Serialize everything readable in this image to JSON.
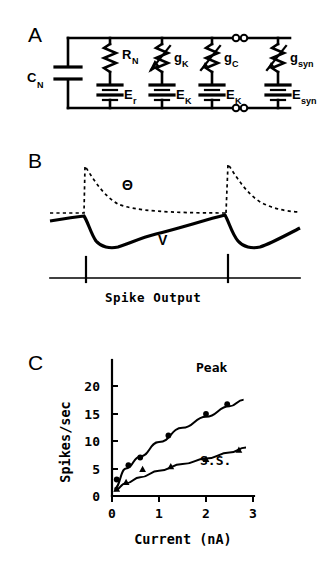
{
  "figure": {
    "panels": [
      {
        "id": "A",
        "letter": "A",
        "name": "equivalent-circuit"
      },
      {
        "id": "B",
        "letter": "B",
        "name": "voltage-threshold-traces"
      },
      {
        "id": "C",
        "letter": "C",
        "name": "fi-curve"
      }
    ]
  },
  "panel_a": {
    "letter": "A",
    "capacitor": {
      "label": "C",
      "sub": "N",
      "name": "membrane-capacitance"
    },
    "branches": [
      {
        "element_label": "R",
        "element_sub": "N",
        "element_type": "resistor",
        "battery_label": "E",
        "battery_sub": "r",
        "name": "leak-branch"
      },
      {
        "element_label": "g",
        "element_sub": "K",
        "element_type": "variable-resistor",
        "battery_label": "E",
        "battery_sub": "K",
        "name": "potassium-branch"
      },
      {
        "element_label": "g",
        "element_sub": "C",
        "element_type": "variable-resistor",
        "battery_label": "E",
        "battery_sub": "K",
        "name": "calcium-activated-branch"
      },
      {
        "element_label": "g",
        "element_sub": "syn",
        "element_type": "variable-resistor",
        "battery_label": "E",
        "battery_sub": "syn",
        "name": "synaptic-branch"
      }
    ]
  },
  "panel_b": {
    "letter": "B",
    "theta_label": "Θ",
    "voltage_label": "V",
    "caption": "Spike Output",
    "spike_times": [
      2,
      2
    ]
  },
  "panel_c": {
    "letter": "C",
    "peak_label": "Peak",
    "ss_label": "S.S."
  },
  "chart_data": {
    "type": "scatter",
    "title": "",
    "xlabel": "Current  (nA)",
    "ylabel": "Spikes/sec",
    "xlim": [
      0,
      3
    ],
    "ylim": [
      0,
      22
    ],
    "xticks": [
      0,
      1,
      2,
      3
    ],
    "xticklabels": [
      "0",
      "1",
      "2",
      "3"
    ],
    "yticks": [
      0,
      5,
      10,
      15,
      20
    ],
    "yticklabels": [
      "0",
      "5",
      "10",
      "15",
      "20"
    ],
    "grid": false,
    "legend_position": "inline-annotation",
    "series": [
      {
        "name": "Peak",
        "marker": "circle",
        "x": [
          0.1,
          0.35,
          0.6,
          1.2,
          2.0,
          2.45
        ],
        "y": [
          3.0,
          5.6,
          7.0,
          11.0,
          14.9,
          16.7
        ],
        "fit_x": [
          0.05,
          0.3,
          0.6,
          1.0,
          1.5,
          2.0,
          2.5,
          2.8
        ],
        "fit_y": [
          1.3,
          5.0,
          7.2,
          9.8,
          12.4,
          14.4,
          16.3,
          17.5
        ]
      },
      {
        "name": "S.S.",
        "marker": "triangle",
        "x": [
          0.1,
          0.3,
          0.65,
          1.25,
          2.0,
          2.7
        ],
        "y": [
          1.3,
          2.5,
          4.9,
          5.4,
          6.7,
          8.4
        ],
        "fit_x": [
          0.05,
          0.3,
          0.6,
          1.0,
          1.5,
          2.0,
          2.5,
          2.85
        ],
        "fit_y": [
          1.0,
          2.3,
          3.4,
          4.6,
          5.8,
          6.8,
          7.9,
          8.8
        ]
      }
    ]
  }
}
